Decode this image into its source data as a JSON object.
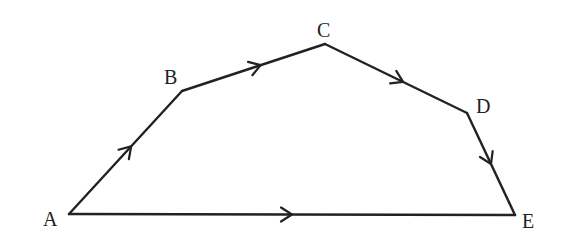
{
  "diagram": {
    "type": "directed-polygon",
    "points": {
      "A": {
        "label": "A",
        "x": 69,
        "y": 214,
        "lx": 43,
        "ly": 226
      },
      "B": {
        "label": "B",
        "x": 182,
        "y": 91,
        "lx": 164,
        "ly": 84
      },
      "C": {
        "label": "C",
        "x": 325,
        "y": 44,
        "lx": 317,
        "ly": 37
      },
      "D": {
        "label": "D",
        "x": 467,
        "y": 113,
        "lx": 476,
        "ly": 113
      },
      "E": {
        "label": "E",
        "x": 515,
        "y": 215,
        "lx": 522,
        "ly": 228
      }
    },
    "edges": [
      {
        "from": "A",
        "to": "B",
        "arrow_t": 0.55
      },
      {
        "from": "B",
        "to": "C",
        "arrow_t": 0.55
      },
      {
        "from": "C",
        "to": "D",
        "arrow_t": 0.55
      },
      {
        "from": "D",
        "to": "E",
        "arrow_t": 0.5
      },
      {
        "from": "A",
        "to": "E",
        "arrow_t": 0.5
      }
    ],
    "stroke_color": "#222222"
  }
}
